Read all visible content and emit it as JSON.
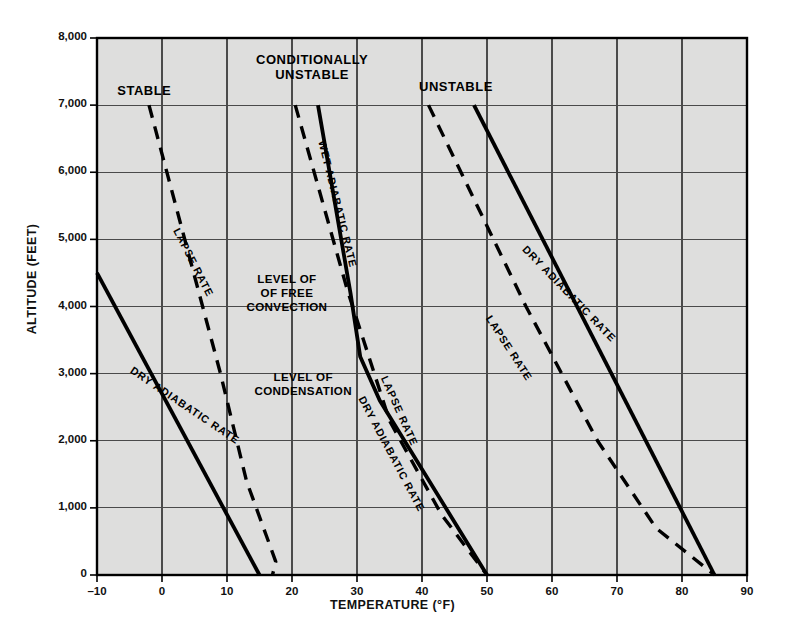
{
  "chart_data": {
    "type": "line",
    "title": "",
    "xlabel": "TEMPERATURE (°F)",
    "ylabel": "ALTITUDE (FEET)",
    "xlim": [
      -10,
      90
    ],
    "ylim": [
      0,
      8000
    ],
    "xticks": [
      -10,
      0,
      10,
      20,
      30,
      40,
      50,
      60,
      70,
      80,
      90
    ],
    "xtick_labels": [
      "–10",
      "0",
      "10",
      "20",
      "30",
      "40",
      "50",
      "60",
      "70",
      "80",
      "90"
    ],
    "yticks": [
      0,
      1000,
      2000,
      3000,
      4000,
      5000,
      6000,
      7000,
      8000
    ],
    "ytick_labels": [
      "0",
      "1,000",
      "2,000",
      "3,000",
      "4,000",
      "5,000",
      "6,000",
      "7,000",
      "8,000"
    ],
    "grid": true,
    "legend_position": "none",
    "plot_background": "#dededd",
    "axis_color": "#000000",
    "grid_color": "#444444",
    "series": [
      {
        "name": "Stable — Dry Adiabatic Rate",
        "style": "solid",
        "group": "stable",
        "points": [
          [
            -10,
            4500
          ],
          [
            15,
            0
          ]
        ]
      },
      {
        "name": "Stable — Lapse Rate",
        "style": "dashed",
        "group": "stable",
        "points": [
          [
            -2,
            7000
          ],
          [
            9,
            3000
          ],
          [
            13,
            1400
          ],
          [
            16,
            600
          ],
          [
            17.5,
            200
          ],
          [
            17,
            0
          ]
        ]
      },
      {
        "name": "Conditionally Unstable — Wet Adiabatic Rate",
        "style": "solid",
        "group": "conditionally-unstable",
        "points": [
          [
            24,
            7000
          ],
          [
            29,
            4200
          ],
          [
            30.5,
            3250
          ],
          [
            33.5,
            2600
          ],
          [
            50,
            0
          ]
        ]
      },
      {
        "name": "Conditionally Unstable — Lapse Rate",
        "style": "dashed",
        "group": "conditionally-unstable",
        "points": [
          [
            20.5,
            7000
          ],
          [
            28.5,
            4250
          ],
          [
            35,
            2300
          ],
          [
            43,
            900
          ],
          [
            50,
            0
          ]
        ]
      },
      {
        "name": "Unstable — Dry Adiabatic Rate",
        "style": "solid",
        "group": "unstable",
        "points": [
          [
            48,
            7000
          ],
          [
            85,
            0
          ]
        ]
      },
      {
        "name": "Unstable — Lapse Rate",
        "style": "dashed",
        "group": "unstable",
        "points": [
          [
            41,
            7000
          ],
          [
            56,
            4000
          ],
          [
            67,
            2000
          ],
          [
            76,
            700
          ],
          [
            85,
            0
          ]
        ]
      }
    ],
    "region_labels": [
      {
        "id": "stable",
        "text": "STABLE",
        "x": 0.5,
        "y": 7200
      },
      {
        "id": "conditionally-unstable",
        "text_line1": "CONDITIONALLY",
        "text_line2": "UNSTABLE",
        "x": 24,
        "y": 7700
      },
      {
        "id": "unstable",
        "text": "UNSTABLE",
        "x": 46,
        "y": 7250
      }
    ],
    "annotations": [
      {
        "id": "level-of-free-convection",
        "lines": [
          "LEVEL OF",
          "OF FREE",
          "CONVECTION"
        ],
        "x": 21,
        "y": 4150
      },
      {
        "id": "level-of-condensation",
        "lines": [
          "LEVEL OF",
          "CONDENSATION"
        ],
        "x": 21,
        "y": 2850
      }
    ],
    "curve_labels": [
      {
        "id": "stable-dry-adiabatic-rate",
        "text": "DRY ADIABATIC RATE"
      },
      {
        "id": "stable-lapse-rate",
        "text": "LAPSE RATE"
      },
      {
        "id": "wet-adiabatic-rate",
        "text": "WET ADIABATIC RATE"
      },
      {
        "id": "cond-lapse-rate",
        "text": "LAPSE RATE"
      },
      {
        "id": "cond-dry-adiabatic-rate",
        "text": "DRY ADIABATIC RATE"
      },
      {
        "id": "unstable-dry-adiabatic-rate",
        "text": "DRY ADIABATIC RATE"
      },
      {
        "id": "unstable-lapse-rate",
        "text": "LAPSE RATE"
      }
    ]
  }
}
